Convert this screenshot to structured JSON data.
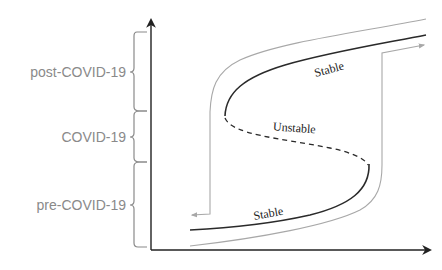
{
  "diagram": {
    "type": "hysteresis-s-curve",
    "phases": [
      {
        "label": "post-COVID-19",
        "color": "#8a8a8a"
      },
      {
        "label": "COVID-19",
        "color": "#8a8a8a"
      },
      {
        "label": "pre-COVID-19",
        "color": "#8a8a8a"
      }
    ],
    "branches": [
      {
        "label": "Stable",
        "position": "upper",
        "style": "solid"
      },
      {
        "label": "Unstable",
        "position": "middle",
        "style": "dashed"
      },
      {
        "label": "Stable",
        "position": "lower",
        "style": "solid"
      }
    ],
    "colors": {
      "axis": "#222222",
      "main_curve": "#2a2a2a",
      "path_curve": "#a8a8a8",
      "brace": "#8a8a8a"
    }
  }
}
